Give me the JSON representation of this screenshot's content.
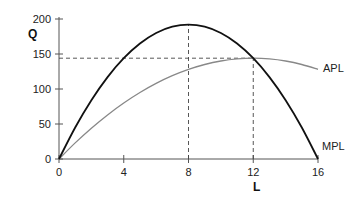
{
  "chart_data": {
    "type": "line",
    "title": "",
    "xlabel": "L",
    "ylabel": "Q",
    "xlim": [
      0,
      16
    ],
    "ylim": [
      0,
      200
    ],
    "xticks": [
      0,
      4,
      8,
      12,
      16
    ],
    "yticks": [
      0,
      50,
      100,
      150,
      200
    ],
    "grid": false,
    "legend": "inline labels at right end of curves",
    "x": [
      0,
      1,
      2,
      3,
      4,
      5,
      6,
      7,
      8,
      9,
      10,
      11,
      12,
      13,
      14,
      15,
      16
    ],
    "series": [
      {
        "name": "MPL",
        "color": "#111111",
        "values": [
          0,
          45,
          84,
          117,
          144,
          165,
          180,
          189,
          192,
          189,
          180,
          165,
          144,
          117,
          84,
          45,
          0
        ]
      },
      {
        "name": "APL",
        "color": "#888888",
        "values": [
          0,
          23,
          44,
          63,
          80,
          95,
          108,
          119,
          128,
          135,
          140,
          143,
          144,
          143,
          140,
          135,
          128
        ]
      }
    ],
    "annotations": [
      {
        "type": "dashed-vertical",
        "x": 8,
        "from": 0,
        "to": 192,
        "note": "MPL maximum"
      },
      {
        "type": "dashed-vertical",
        "x": 12,
        "from": 0,
        "to": 144,
        "note": "APL maximum, MPL = APL"
      },
      {
        "type": "dashed-horizontal",
        "y": 144,
        "from": 0,
        "to": 12
      }
    ]
  },
  "labels": {
    "y_axis": "Q",
    "x_axis": "L",
    "mpl": "MPL",
    "apl": "APL",
    "yticks": [
      "0",
      "50",
      "100",
      "150",
      "200"
    ],
    "xticks": [
      "0",
      "4",
      "8",
      "12",
      "16"
    ]
  }
}
